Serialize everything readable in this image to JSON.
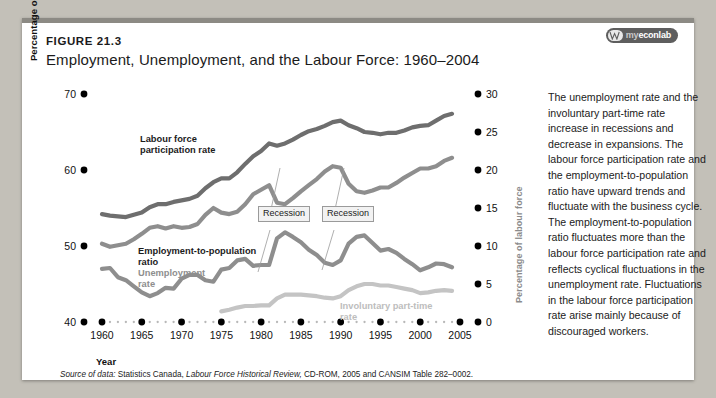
{
  "figure": {
    "number": "FIGURE 21.3",
    "title": "Employment, Unemployment, and the Labour Force: 1960–2004"
  },
  "logo": {
    "mark": "myeconlab-w-icon",
    "prefix": "my",
    "name": "econlab"
  },
  "commentary": "The unemployment rate and the involuntary part-time rate increase in recessions and decrease in expansions. The labour force participation rate and the employment-to-population ratio have upward trends and fluctuate with the business cycle. The employment-to-population ratio fluctuates more than the labour force participation rate and reflects cyclical fluctuations in the unemployment rate. Fluctuations in the labour force participation rate arise mainly because of discouraged workers.",
  "source": {
    "prefix": "Source of data:",
    "body_1": " Statistics Canada, ",
    "italic": "Labour Force Historical Review,",
    "body_2": " CD-ROM, 2005 and CANSIM Table 282–0002."
  },
  "annotations": [
    {
      "label": "Recession",
      "x": 236,
      "y": 188
    },
    {
      "label": "Recession",
      "x": 300,
      "y": 188
    }
  ],
  "series_labels": [
    {
      "label": "Labour force",
      "tone": "dark",
      "x": 118,
      "y": 116
    },
    {
      "label": "participation rate",
      "tone": "dark",
      "x": 118,
      "y": 127
    },
    {
      "label": "Employment-to-population",
      "tone": "dark",
      "x": 116,
      "y": 228
    },
    {
      "label": "ratio",
      "tone": "dark",
      "x": 116,
      "y": 239
    },
    {
      "label": "Unemployment",
      "tone": "gray",
      "x": 116,
      "y": 250
    },
    {
      "label": "rate",
      "tone": "gray",
      "x": 116,
      "y": 261
    },
    {
      "label": "Involuntary part-time",
      "tone": "lgray",
      "x": 318,
      "y": 283
    },
    {
      "label": "rate",
      "tone": "lgray",
      "x": 318,
      "y": 294
    }
  ],
  "colors": {
    "dark_line": "#6e6e6e",
    "mid_line": "#8e8e8e",
    "light_line": "#c4c4c4",
    "axis_dot": "#000000",
    "minor_dot": "#b8b8b8",
    "right_axis_label": "#8b8b8b",
    "card": "#ffffff",
    "page": "#c3c0b8",
    "topbar": "#8c8a84"
  },
  "chart_data": {
    "type": "line",
    "title": "Employment, Unemployment, and the Labour Force: 1960–2004",
    "xlabel": "Year",
    "ylabel": "Percentage of working-age population",
    "y2label": "Percentage of labour force",
    "xlim": [
      1960,
      2005
    ],
    "ylim": [
      40,
      70
    ],
    "y2lim": [
      0,
      30
    ],
    "grid": false,
    "legend": "inline-labels",
    "xticks": [
      1960,
      1965,
      1970,
      1975,
      1980,
      1985,
      1990,
      1995,
      2000,
      2005
    ],
    "yticks": [
      40,
      50,
      60,
      70
    ],
    "y2ticks": [
      0,
      5,
      10,
      15,
      20,
      25,
      30
    ],
    "x": [
      1960,
      1961,
      1962,
      1963,
      1964,
      1965,
      1966,
      1967,
      1968,
      1969,
      1970,
      1971,
      1972,
      1973,
      1974,
      1975,
      1976,
      1977,
      1978,
      1979,
      1980,
      1981,
      1982,
      1983,
      1984,
      1985,
      1986,
      1987,
      1988,
      1989,
      1990,
      1991,
      1992,
      1993,
      1994,
      1995,
      1996,
      1997,
      1998,
      1999,
      2000,
      2001,
      2002,
      2003,
      2004
    ],
    "series": [
      {
        "name": "Labour force participation rate",
        "axis": "left",
        "color": "#6e6e6e",
        "values": [
          54.2,
          54.0,
          53.9,
          53.8,
          54.1,
          54.4,
          55.1,
          55.5,
          55.5,
          55.8,
          56.0,
          56.2,
          56.6,
          57.6,
          58.4,
          58.9,
          58.9,
          59.7,
          60.8,
          61.8,
          62.5,
          63.5,
          63.2,
          63.5,
          64.0,
          64.6,
          65.1,
          65.4,
          65.8,
          66.3,
          66.5,
          65.9,
          65.5,
          65.0,
          64.9,
          64.7,
          64.9,
          64.9,
          65.2,
          65.6,
          65.8,
          65.9,
          66.5,
          67.1,
          67.4
        ]
      },
      {
        "name": "Employment-to-population ratio",
        "axis": "left",
        "color": "#8e8e8e",
        "values": [
          50.3,
          49.9,
          50.1,
          50.3,
          50.9,
          51.6,
          52.4,
          52.6,
          52.3,
          52.6,
          52.4,
          52.5,
          52.9,
          54.1,
          55.0,
          54.4,
          54.2,
          54.5,
          55.5,
          56.8,
          57.4,
          58.0,
          55.7,
          55.5,
          56.3,
          57.2,
          58.0,
          58.8,
          59.8,
          60.5,
          60.3,
          58.2,
          57.2,
          57.0,
          57.3,
          57.7,
          57.7,
          58.3,
          59.0,
          59.6,
          60.2,
          60.2,
          60.5,
          61.2,
          61.6
        ]
      },
      {
        "name": "Unemployment rate",
        "axis": "right",
        "color": "#8e8e8e",
        "values": [
          7.0,
          7.1,
          5.9,
          5.5,
          4.7,
          3.9,
          3.4,
          3.8,
          4.5,
          4.4,
          5.7,
          6.2,
          6.2,
          5.5,
          5.3,
          6.9,
          7.1,
          8.1,
          8.3,
          7.4,
          7.5,
          7.5,
          11.0,
          11.8,
          11.2,
          10.5,
          9.5,
          8.8,
          7.8,
          7.5,
          8.1,
          10.3,
          11.2,
          11.4,
          10.4,
          9.4,
          9.6,
          9.1,
          8.3,
          7.6,
          6.8,
          7.2,
          7.7,
          7.6,
          7.2
        ]
      },
      {
        "name": "Involuntary part-time rate",
        "axis": "right",
        "color": "#c4c4c4",
        "values": [
          null,
          null,
          null,
          null,
          null,
          null,
          null,
          null,
          null,
          null,
          null,
          null,
          null,
          null,
          null,
          1.4,
          1.6,
          1.9,
          2.1,
          2.1,
          2.2,
          2.2,
          3.1,
          3.6,
          3.6,
          3.6,
          3.5,
          3.4,
          3.2,
          3.1,
          3.4,
          4.2,
          4.7,
          5.0,
          5.0,
          4.8,
          4.8,
          4.6,
          4.4,
          4.2,
          3.8,
          3.9,
          4.1,
          4.2,
          4.1
        ]
      }
    ]
  }
}
